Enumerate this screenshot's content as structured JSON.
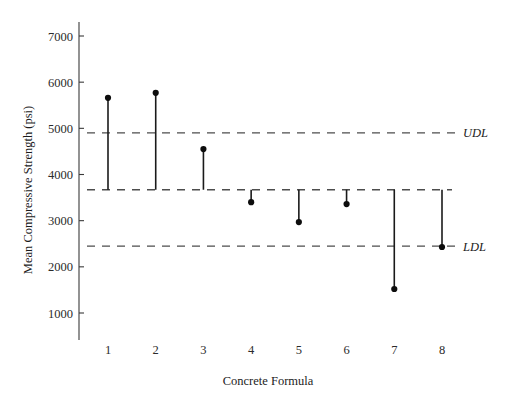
{
  "chart_data": {
    "type": "line",
    "title": "",
    "xlabel": "Concrete Formula",
    "ylabel": "Mean Compressive Strength (psi)",
    "categories": [
      "1",
      "2",
      "3",
      "4",
      "5",
      "6",
      "7",
      "8"
    ],
    "values": [
      5660,
      5770,
      4550,
      3400,
      2970,
      3360,
      1520,
      2430
    ],
    "series": [
      {
        "name": "Mean Compressive Strength",
        "values": [
          5660,
          5770,
          4550,
          3400,
          2970,
          3360,
          1520,
          2430
        ]
      }
    ],
    "stem_baseline": 3670,
    "ylim": [
      500,
      7400
    ],
    "xlim": [
      0.5,
      8.5
    ],
    "yticks": [
      1000,
      2000,
      3000,
      4000,
      5000,
      6000,
      7000
    ],
    "ytick_labels": [
      "1000",
      "2000",
      "3000",
      "4000",
      "5000",
      "6000",
      "7000"
    ],
    "xticks": [
      1,
      2,
      3,
      4,
      5,
      6,
      7,
      8
    ],
    "xtick_labels": [
      "1",
      "2",
      "3",
      "4",
      "5",
      "6",
      "7",
      "8"
    ],
    "grid": false,
    "legend": "none",
    "reference_lines": [
      {
        "name": "UDL",
        "label": "UDL",
        "value": 4900,
        "style": "dashed",
        "labeled": true
      },
      {
        "name": "CENTER",
        "label": "",
        "value": 3670,
        "style": "dashed",
        "labeled": false
      },
      {
        "name": "LDL",
        "label": "LDL",
        "value": 2450,
        "style": "dashed",
        "labeled": true
      }
    ],
    "marker": "filled-circle",
    "colors": {
      "line": "#1a1a1a",
      "marker": "#0d0d0d",
      "reference": "#4d4d4d",
      "axis": "#3a3a3a",
      "background": "#ffffff"
    }
  }
}
